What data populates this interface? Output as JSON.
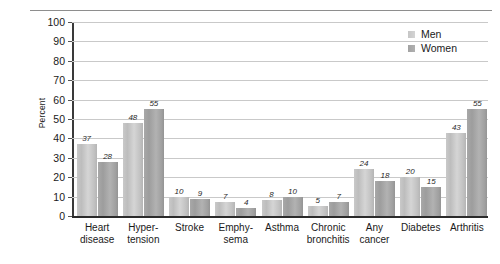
{
  "chart_data": {
    "type": "bar",
    "title": "",
    "subtitle": "",
    "xlabel": "",
    "ylabel": "Percent",
    "ylim": [
      0,
      100
    ],
    "ytick_step": 10,
    "grid": true,
    "legend_position": "top-right",
    "categories": [
      "Heart disease",
      "Hypertension",
      "Stroke",
      "Emphysema",
      "Asthma",
      "Chronic bronchitis",
      "Any cancer",
      "Diabetes",
      "Arthritis"
    ],
    "category_lines": [
      [
        "Heart",
        "disease"
      ],
      [
        "Hyper-",
        "tension"
      ],
      [
        "Stroke",
        ""
      ],
      [
        "Emphy-",
        "sema"
      ],
      [
        "Asthma",
        ""
      ],
      [
        "Chronic",
        "bronchitis"
      ],
      [
        "Any",
        "cancer"
      ],
      [
        "Diabetes",
        ""
      ],
      [
        "Arthritis",
        ""
      ]
    ],
    "series": [
      {
        "name": "Men",
        "values": [
          37,
          48,
          10,
          7,
          8,
          5,
          24,
          20,
          43
        ],
        "color": "#c9c9c9"
      },
      {
        "name": "Women",
        "values": [
          28,
          55,
          9,
          4,
          10,
          7,
          18,
          15,
          55
        ],
        "color": "#a5a5a5"
      }
    ],
    "ytick_labels": [
      "100",
      "90",
      "80",
      "70",
      "60",
      "50",
      "40",
      "30",
      "20",
      "10",
      "0"
    ]
  },
  "legend": {
    "items": [
      {
        "label": "Men"
      },
      {
        "label": "Women"
      }
    ]
  },
  "axes": {
    "y_title": "Percent"
  }
}
